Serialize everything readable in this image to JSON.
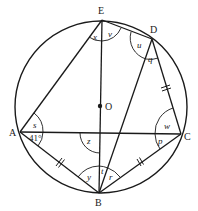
{
  "diagram": {
    "type": "circle-geometry",
    "circle": {
      "center_label": "O"
    },
    "points": [
      {
        "label": "E",
        "role": "top"
      },
      {
        "label": "D",
        "role": "upper-right"
      },
      {
        "label": "A",
        "role": "left"
      },
      {
        "label": "C",
        "role": "right"
      },
      {
        "label": "B",
        "role": "bottom"
      },
      {
        "label": "O",
        "role": "center"
      }
    ],
    "segments": [
      "EA",
      "ED",
      "EB",
      "DB",
      "DC",
      "AC",
      "AB",
      "BC"
    ],
    "equal_marks": [
      "AB",
      "BC",
      "DC"
    ],
    "angles": {
      "x": "x",
      "v": "v",
      "u": "u",
      "q": "q",
      "s": "s",
      "a41": "41°",
      "z": "z",
      "w": "w",
      "p": "p",
      "y": "y",
      "t": "t",
      "r": "r"
    },
    "labels": {
      "E": "E",
      "D": "D",
      "A": "A",
      "C": "C",
      "B": "B",
      "O": "O"
    }
  }
}
